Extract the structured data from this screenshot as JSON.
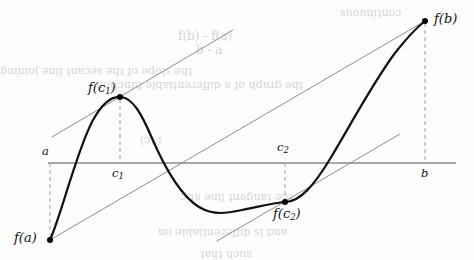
{
  "figure": {
    "canvas": {
      "width": 474,
      "height": 260,
      "background": "#fdfdfc"
    },
    "colors": {
      "curve": "#111111",
      "axis": "#8a8a8a",
      "secant": "#8d8d8d",
      "tangent": "#8d8d8d",
      "dashed": "#a8a8a8",
      "point": "#000000",
      "label": "#101010",
      "bleed_text": "#d9d6d2"
    }
  },
  "axis": {
    "name": "horizontal-axis",
    "y": 163,
    "x_start": 48,
    "x_end": 456,
    "stroke_width": 1.6
  },
  "labels": {
    "a": "a",
    "b": "b",
    "c1": "c",
    "c1_sub": "1",
    "c2": "c",
    "c2_sub": "2",
    "fa_prefix": "f(",
    "fa": "f(a)",
    "fb": "f(b)",
    "fc1_open": "f(c",
    "fc1_sub": "1",
    "fc1_close": ")",
    "fc2_open": "f(c",
    "fc2_sub": "2",
    "fc2_close": ")"
  },
  "points": [
    {
      "name": "point-fa",
      "label": "f(a)",
      "x": 50,
      "y": 240,
      "radius": 3.0
    },
    {
      "name": "point-fc1",
      "label": "f(c1)",
      "x": 120,
      "y": 97,
      "radius": 3.0
    },
    {
      "name": "point-fc2",
      "label": "f(c2)",
      "x": 285,
      "y": 202,
      "radius": 3.0
    },
    {
      "name": "point-fb",
      "label": "f(b)",
      "x": 425,
      "y": 21,
      "radius": 3.0
    }
  ],
  "dashed_lines": [
    {
      "name": "dash-a",
      "x": 50,
      "y1": 163,
      "y2": 238
    },
    {
      "name": "dash-c1",
      "x": 120,
      "y1": 99,
      "y2": 163
    },
    {
      "name": "dash-c2",
      "x": 285,
      "y1": 163,
      "y2": 200
    },
    {
      "name": "dash-b",
      "x": 425,
      "y1": 23,
      "y2": 163
    }
  ],
  "secant_line": {
    "name": "secant-line-ab",
    "x1": 50,
    "y1": 240,
    "x2": 425,
    "y2": 21
  },
  "tangent_lines": [
    {
      "name": "tangent-line-c1",
      "x1": 52,
      "y1": 137,
      "x2": 233,
      "y2": 30
    },
    {
      "name": "tangent-line-c2",
      "x1": 217,
      "y1": 241,
      "x2": 400,
      "y2": 134
    }
  ],
  "curve": {
    "name": "function-curve",
    "stroke_width": 2.2,
    "path": "M 50 240 C 62 213, 76 153, 92 122 C 102 103, 112 96, 121 97 C 133 98, 142 115, 151 136 C 166 171, 181 196, 199 207 C 214 216, 228 213, 242 210 C 258 207, 272 203, 286 202 C 300 201, 313 187, 330 159 C 350 126, 372 84, 395 53 C 406 39, 416 28, 425 21"
  },
  "text_positions": {
    "a": {
      "x": 42,
      "y": 146
    },
    "b": {
      "x": 421,
      "y": 168
    },
    "c1": {
      "x": 112,
      "y": 168
    },
    "c2": {
      "x": 277,
      "y": 142
    },
    "fa": {
      "x": 14,
      "y": 231
    },
    "fb": {
      "x": 434,
      "y": 12
    },
    "fc1": {
      "x": 88,
      "y": 81
    },
    "fc2": {
      "x": 273,
      "y": 207
    }
  },
  "bleed_through_text": [
    {
      "text": "f(b) - f(a)",
      "x": 178,
      "y": 30,
      "size": 12,
      "rotate": 0
    },
    {
      "text": "b - a",
      "x": 196,
      "y": 44,
      "size": 12,
      "rotate": 0
    },
    {
      "text": "the slope of the secant line joining",
      "x": 0,
      "y": 66,
      "size": 11,
      "rotate": 180
    },
    {
      "text": "the graph of a differentiable function",
      "x": 96,
      "y": 80,
      "size": 11,
      "rotate": 180
    },
    {
      "text": "f'(c)",
      "x": 140,
      "y": 135,
      "size": 11,
      "rotate": 180
    },
    {
      "text": "the tangent line at c",
      "x": 180,
      "y": 192,
      "size": 11,
      "rotate": 180
    },
    {
      "text": "and is differentiable on",
      "x": 158,
      "y": 227,
      "size": 11,
      "rotate": 180
    },
    {
      "text": "such that",
      "x": 200,
      "y": 249,
      "size": 11,
      "rotate": 180
    },
    {
      "text": "continuous",
      "x": 340,
      "y": 8,
      "size": 11,
      "rotate": 180
    }
  ]
}
